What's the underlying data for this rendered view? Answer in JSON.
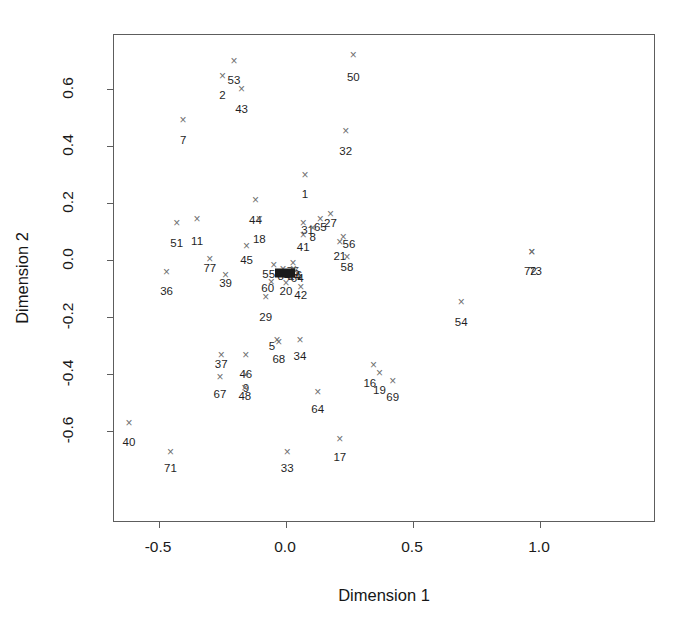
{
  "chart_data": {
    "type": "scatter",
    "title": "",
    "xlabel": "Dimension 1",
    "ylabel": "Dimension 2",
    "xlim": [
      -0.66,
      1.05
    ],
    "ylim": [
      -0.73,
      0.745
    ],
    "xticks": [
      -0.5,
      0.0,
      0.5,
      1.0
    ],
    "xticklabels": [
      "-0.5",
      "0.0",
      "0.5",
      "1.0"
    ],
    "yticks": [
      0.6,
      0.4,
      0.2,
      0.0,
      -0.2,
      -0.4,
      -0.6
    ],
    "yticklabels": [
      "0.6",
      "0.4",
      "0.2",
      "0.0",
      "-0.2",
      "-0.4",
      "-0.6"
    ],
    "grid": false,
    "legend": null,
    "marker": "x",
    "marker_color": "#6e6e6e",
    "frame_color": "#5d5d5d",
    "label_color": "#1f1f1f",
    "points": [
      {
        "id": "53",
        "x": -0.205,
        "y": 0.7,
        "lx": -0.205,
        "ly": 0.648
      },
      {
        "id": "50",
        "x": 0.265,
        "y": 0.718,
        "lx": 0.265,
        "ly": 0.66
      },
      {
        "id": "2",
        "x": -0.25,
        "y": 0.645,
        "lx": -0.25,
        "ly": 0.596
      },
      {
        "id": "43",
        "x": -0.175,
        "y": 0.6,
        "lx": -0.175,
        "ly": 0.548
      },
      {
        "id": "32",
        "x": 0.235,
        "y": 0.452,
        "lx": 0.235,
        "ly": 0.4
      },
      {
        "id": "7",
        "x": -0.405,
        "y": 0.492,
        "lx": -0.405,
        "ly": 0.44
      },
      {
        "id": "1",
        "x": 0.075,
        "y": 0.3,
        "lx": 0.075,
        "ly": 0.248
      },
      {
        "id": "44",
        "x": -0.12,
        "y": 0.21,
        "lx": -0.12,
        "ly": 0.158
      },
      {
        "id": "27",
        "x": 0.175,
        "y": 0.16,
        "lx": 0.175,
        "ly": 0.148
      },
      {
        "id": "65",
        "x": 0.135,
        "y": 0.145,
        "lx": 0.135,
        "ly": 0.132
      },
      {
        "id": "51",
        "x": -0.43,
        "y": 0.13,
        "lx": -0.43,
        "ly": 0.078
      },
      {
        "id": "11",
        "x": -0.35,
        "y": 0.145,
        "lx": -0.35,
        "ly": 0.085
      },
      {
        "id": "18",
        "x": -0.105,
        "y": 0.145,
        "lx": -0.105,
        "ly": 0.092
      },
      {
        "id": "31",
        "x": 0.068,
        "y": 0.13,
        "lx": 0.085,
        "ly": 0.122
      },
      {
        "id": "8",
        "x": 0.105,
        "y": 0.112,
        "lx": 0.105,
        "ly": 0.098
      },
      {
        "id": "41",
        "x": 0.068,
        "y": 0.088,
        "lx": 0.068,
        "ly": 0.062
      },
      {
        "id": "56",
        "x": 0.225,
        "y": 0.082,
        "lx": 0.248,
        "ly": 0.072
      },
      {
        "id": "21",
        "x": 0.212,
        "y": 0.062,
        "lx": 0.212,
        "ly": 0.032
      },
      {
        "id": "45",
        "x": -0.155,
        "y": 0.048,
        "lx": -0.155,
        "ly": 0.018
      },
      {
        "id": "58",
        "x": 0.24,
        "y": 0.012,
        "lx": 0.24,
        "ly": -0.008
      },
      {
        "id": "77",
        "x": -0.3,
        "y": 0.002,
        "lx": -0.3,
        "ly": -0.012
      },
      {
        "id": "36",
        "x": -0.47,
        "y": -0.042,
        "lx": -0.47,
        "ly": -0.092
      },
      {
        "id": "72",
        "x": 0.968,
        "y": 0.028,
        "lx": 0.962,
        "ly": -0.022
      },
      {
        "id": "73",
        "x": 0.968,
        "y": 0.028,
        "lx": 0.982,
        "ly": -0.022
      },
      {
        "id": "39",
        "x": -0.238,
        "y": -0.052,
        "lx": -0.238,
        "ly": -0.062
      },
      {
        "id": "55",
        "x": -0.048,
        "y": -0.018,
        "lx": -0.068,
        "ly": -0.03
      },
      {
        "id": "84",
        "x": -0.012,
        "y": -0.032,
        "lx": -0.008,
        "ly": -0.038
      },
      {
        "id": "75",
        "x": 0.028,
        "y": -0.01,
        "lx": 0.028,
        "ly": -0.02
      },
      {
        "id": "76",
        "x": 0.03,
        "y": -0.03,
        "lx": 0.038,
        "ly": -0.034
      },
      {
        "id": "24",
        "x": 0.03,
        "y": -0.036,
        "lx": 0.034,
        "ly": -0.04
      },
      {
        "id": "64b",
        "x": 0.036,
        "y": -0.04,
        "lx": 0.044,
        "ly": -0.044
      },
      {
        "id": "60",
        "x": -0.058,
        "y": -0.078,
        "lx": -0.072,
        "ly": -0.082
      },
      {
        "id": "20",
        "x": 0.0,
        "y": -0.082,
        "lx": 0.0,
        "ly": -0.092
      },
      {
        "id": "42",
        "x": 0.058,
        "y": -0.095,
        "lx": 0.058,
        "ly": -0.105
      },
      {
        "id": "29",
        "x": -0.08,
        "y": -0.13,
        "lx": -0.08,
        "ly": -0.182
      },
      {
        "id": "54",
        "x": 0.69,
        "y": -0.148,
        "lx": 0.69,
        "ly": -0.2
      },
      {
        "id": "5",
        "x": -0.035,
        "y": -0.282,
        "lx": -0.055,
        "ly": -0.285
      },
      {
        "id": "68",
        "x": -0.028,
        "y": -0.288,
        "lx": -0.028,
        "ly": -0.33
      },
      {
        "id": "34",
        "x": 0.055,
        "y": -0.282,
        "lx": 0.055,
        "ly": -0.318
      },
      {
        "id": "37",
        "x": -0.255,
        "y": -0.335,
        "lx": -0.255,
        "ly": -0.348
      },
      {
        "id": "46",
        "x": -0.158,
        "y": -0.332,
        "lx": -0.158,
        "ly": -0.382
      },
      {
        "id": "16",
        "x": 0.345,
        "y": -0.368,
        "lx": 0.33,
        "ly": -0.415
      },
      {
        "id": "19",
        "x": 0.368,
        "y": -0.395,
        "lx": 0.368,
        "ly": -0.438
      },
      {
        "id": "69",
        "x": 0.42,
        "y": -0.425,
        "lx": 0.42,
        "ly": -0.462
      },
      {
        "id": "67",
        "x": -0.26,
        "y": -0.41,
        "lx": -0.26,
        "ly": -0.452
      },
      {
        "id": "9",
        "x": -0.158,
        "y": -0.405,
        "lx": -0.158,
        "ly": -0.432
      },
      {
        "id": "48",
        "x": -0.162,
        "y": -0.448,
        "lx": -0.162,
        "ly": -0.46
      },
      {
        "id": "64",
        "x": 0.125,
        "y": -0.462,
        "lx": 0.125,
        "ly": -0.505
      },
      {
        "id": "40",
        "x": -0.618,
        "y": -0.572,
        "lx": -0.618,
        "ly": -0.622
      },
      {
        "id": "17",
        "x": 0.212,
        "y": -0.628,
        "lx": 0.212,
        "ly": -0.672
      },
      {
        "id": "33",
        "x": 0.005,
        "y": -0.672,
        "lx": 0.005,
        "ly": -0.712
      },
      {
        "id": "71",
        "x": -0.455,
        "y": -0.672,
        "lx": -0.455,
        "ly": -0.712
      }
    ],
    "dark_cluster": {
      "note": "dense overplotted block of markers near origin",
      "x": -0.005,
      "y": -0.046,
      "width_px": 20,
      "height_px": 9,
      "color": "#1b1b1b"
    }
  }
}
